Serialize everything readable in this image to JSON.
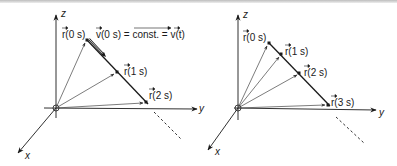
{
  "figure": {
    "left_panel": {
      "axes": {
        "z": "z",
        "y": "y",
        "x": "x"
      },
      "position_labels": [
        "r(0 s)",
        "r(1 s)",
        "r(2 s)"
      ],
      "velocity_label_left": "v(0 s) = ",
      "velocity_label_const": "const.",
      "velocity_label_right": " = v(t)"
    },
    "right_panel": {
      "axes": {
        "z": "z",
        "y": "y",
        "x": "x"
      },
      "position_labels": [
        "r(0 s)",
        "r(1 s)",
        "r(2 s)",
        "r(3 s)"
      ]
    },
    "colors": {
      "stroke": "#1a1a1a",
      "arrow_gray": "#555555",
      "background": "#ffffff"
    }
  }
}
